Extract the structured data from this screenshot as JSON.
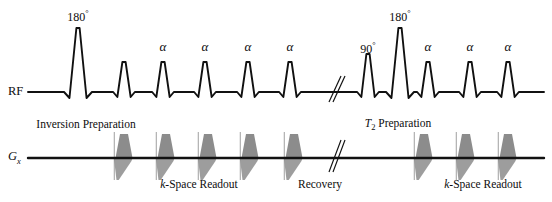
{
  "figure": {
    "type": "mri-pulse-sequence-diagram",
    "width": 552,
    "height": 202,
    "background_color": "#ffffff",
    "line_color": "#111111",
    "gradient_fill_color": "#8c8c8c"
  },
  "axes": [
    {
      "name": "rf",
      "label": "RF",
      "baseline_y": 92,
      "label_x": 8,
      "label_y": 86
    },
    {
      "name": "gx",
      "label": "Gx",
      "label_main": "G",
      "label_sub": "x",
      "baseline_y": 158,
      "label_x": 8,
      "label_y": 151
    }
  ],
  "rf": {
    "axis_label": "RF",
    "pulses": [
      {
        "id": "rf-pulse-inv-180",
        "label": "180",
        "degree": true,
        "x": 78,
        "amplitude": 64,
        "label_x": 78,
        "label_y": 9
      },
      {
        "id": "rf-pulse-exc-1",
        "label": "",
        "degree": false,
        "x": 124,
        "amplitude": 30,
        "label_x": 124,
        "label_y": 0
      },
      {
        "id": "rf-pulse-alpha-1",
        "label": "α",
        "degree": false,
        "x": 163,
        "amplitude": 30,
        "label_x": 163,
        "label_y": 40
      },
      {
        "id": "rf-pulse-alpha-2",
        "label": "α",
        "degree": false,
        "x": 205,
        "amplitude": 30,
        "label_x": 205,
        "label_y": 40
      },
      {
        "id": "rf-pulse-alpha-3",
        "label": "α",
        "degree": false,
        "x": 248,
        "amplitude": 30,
        "label_x": 248,
        "label_y": 40
      },
      {
        "id": "rf-pulse-alpha-4",
        "label": "α",
        "degree": false,
        "x": 290,
        "amplitude": 30,
        "label_x": 290,
        "label_y": 40
      },
      {
        "id": "rf-pulse-t2-90",
        "label": "90",
        "degree": true,
        "x": 368,
        "amplitude": 38,
        "label_x": 368,
        "label_y": 41
      },
      {
        "id": "rf-pulse-t2-180",
        "label": "180",
        "degree": true,
        "x": 400,
        "amplitude": 64,
        "label_x": 400,
        "label_y": 9
      },
      {
        "id": "rf-pulse-alpha-5",
        "label": "α",
        "degree": false,
        "x": 428,
        "amplitude": 30,
        "label_x": 428,
        "label_y": 40
      },
      {
        "id": "rf-pulse-alpha-6",
        "label": "α",
        "degree": false,
        "x": 470,
        "amplitude": 30,
        "label_x": 470,
        "label_y": 40
      },
      {
        "id": "rf-pulse-alpha-7",
        "label": "α",
        "degree": false,
        "x": 508,
        "amplitude": 30,
        "label_x": 508,
        "label_y": 40
      }
    ],
    "break_mark_x": 337
  },
  "gx": {
    "axis_label_main": "G",
    "axis_label_sub": "x",
    "readout_lobes_left_x": [
      124,
      166,
      208,
      250,
      294
    ],
    "readout_lobes_right_x": [
      424,
      466,
      508
    ],
    "break_mark_x": 337
  },
  "annotations": [
    {
      "id": "inversion-preparation",
      "text": "Inversion Preparation",
      "x": 86,
      "y": 119,
      "align": "center"
    },
    {
      "id": "t2-preparation",
      "text": "T2 Preparation",
      "t_italic": "T",
      "t_sub": "2",
      "t_rest": " Preparation",
      "x": 398,
      "y": 118,
      "align": "center"
    },
    {
      "id": "k-space-readout-left",
      "text": "k-Space Readout",
      "k_italic": "k",
      "rest": "-Space Readout",
      "x": 199,
      "y": 179,
      "align": "center"
    },
    {
      "id": "recovery",
      "text": "Recovery",
      "x": 320,
      "y": 179,
      "align": "center"
    },
    {
      "id": "k-space-readout-right",
      "text": "k-Space Readout",
      "k_italic": "k",
      "rest": "-Space Readout",
      "x": 483,
      "y": 179,
      "align": "center"
    }
  ]
}
